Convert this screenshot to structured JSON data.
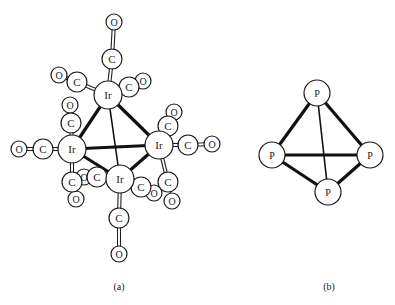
{
  "figure": {
    "panels": [
      {
        "id": "a",
        "caption": "(a)",
        "molecule": "Ir4(CO)12",
        "atoms": {
          "ir_top": {
            "label": "Ir",
            "x": 108,
            "y": 95,
            "r": 14
          },
          "ir_left": {
            "label": "Ir",
            "x": 72,
            "y": 149,
            "r": 14
          },
          "ir_right": {
            "label": "Ir",
            "x": 159,
            "y": 145,
            "r": 14
          },
          "ir_bottom": {
            "label": "Ir",
            "x": 120,
            "y": 179,
            "r": 14
          },
          "c1": {
            "label": "C",
            "x": 112,
            "y": 59,
            "r": 10
          },
          "o1": {
            "label": "O",
            "x": 114,
            "y": 22,
            "r": 8
          },
          "c2": {
            "label": "C",
            "x": 77,
            "y": 82,
            "r": 10
          },
          "o2": {
            "label": "O",
            "x": 59,
            "y": 75,
            "r": 8
          },
          "c3": {
            "label": "C",
            "x": 129,
            "y": 87,
            "r": 10
          },
          "o3": {
            "label": "O",
            "x": 143,
            "y": 81,
            "r": 8
          },
          "c4": {
            "label": "C",
            "x": 71,
            "y": 123,
            "r": 10
          },
          "o4": {
            "label": "O",
            "x": 70,
            "y": 105,
            "r": 8
          },
          "c5": {
            "label": "C",
            "x": 43,
            "y": 149,
            "r": 10
          },
          "o5": {
            "label": "O",
            "x": 19,
            "y": 149,
            "r": 8
          },
          "c6": {
            "label": "C",
            "x": 72,
            "y": 182,
            "r": 10
          },
          "o6": {
            "label": "O",
            "x": 76,
            "y": 199,
            "r": 8
          },
          "c7": {
            "label": "C",
            "x": 168,
            "y": 126,
            "r": 10
          },
          "o7": {
            "label": "O",
            "x": 174,
            "y": 112,
            "r": 8
          },
          "c8": {
            "label": "C",
            "x": 188,
            "y": 145,
            "r": 10
          },
          "o8": {
            "label": "O",
            "x": 212,
            "y": 144,
            "r": 8
          },
          "c9": {
            "label": "C",
            "x": 168,
            "y": 182,
            "r": 10
          },
          "o9": {
            "label": "O",
            "x": 172,
            "y": 201,
            "r": 8
          },
          "c10": {
            "label": "C",
            "x": 119,
            "y": 218,
            "r": 10
          },
          "o10": {
            "label": "O",
            "x": 119,
            "y": 254,
            "r": 8
          },
          "c11": {
            "label": "C",
            "x": 97,
            "y": 177,
            "r": 10
          },
          "o11": {
            "label": "O",
            "x": 84,
            "y": 177,
            "r": 8
          },
          "c12": {
            "label": "C",
            "x": 141,
            "y": 187,
            "r": 10
          },
          "o12": {
            "label": "O",
            "x": 154,
            "y": 193,
            "r": 8
          }
        }
      },
      {
        "id": "b",
        "caption": "(b)",
        "molecule": "P4",
        "atoms": {
          "p_top": {
            "label": "P",
            "x": 317,
            "y": 93,
            "r": 13
          },
          "p_left": {
            "label": "P",
            "x": 272,
            "y": 155,
            "r": 13
          },
          "p_right": {
            "label": "P",
            "x": 370,
            "y": 155,
            "r": 13
          },
          "p_bottom": {
            "label": "P",
            "x": 328,
            "y": 192,
            "r": 13
          }
        }
      }
    ]
  }
}
